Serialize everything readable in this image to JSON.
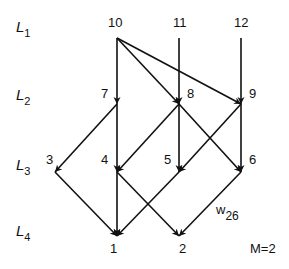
{
  "diagram": {
    "layers": [
      {
        "id": "L1",
        "base": "L",
        "sub": "1",
        "x": 16,
        "y": 19
      },
      {
        "id": "L2",
        "base": "L",
        "sub": "2",
        "x": 16,
        "y": 87
      },
      {
        "id": "L3",
        "base": "L",
        "sub": "3",
        "x": 16,
        "y": 157
      },
      {
        "id": "L4",
        "base": "L",
        "sub": "4",
        "x": 16,
        "y": 223
      }
    ],
    "nodes": [
      {
        "id": "10",
        "label": "10",
        "x": 117,
        "y": 38,
        "lx": 108,
        "ly": 16
      },
      {
        "id": "11",
        "label": "11",
        "x": 179,
        "y": 38,
        "lx": 173,
        "ly": 16
      },
      {
        "id": "12",
        "label": "12",
        "x": 241,
        "y": 38,
        "lx": 234,
        "ly": 16
      },
      {
        "id": "7",
        "label": "7",
        "x": 117,
        "y": 104,
        "lx": 101,
        "ly": 87
      },
      {
        "id": "8",
        "label": "8",
        "x": 179,
        "y": 104,
        "lx": 187,
        "ly": 87
      },
      {
        "id": "9",
        "label": "9",
        "x": 241,
        "y": 104,
        "lx": 249,
        "ly": 87
      },
      {
        "id": "3",
        "label": "3",
        "x": 55,
        "y": 172,
        "lx": 46,
        "ly": 153
      },
      {
        "id": "4",
        "label": "4",
        "x": 117,
        "y": 172,
        "lx": 101,
        "ly": 153
      },
      {
        "id": "5",
        "label": "5",
        "x": 179,
        "y": 172,
        "lx": 164,
        "ly": 153
      },
      {
        "id": "6",
        "label": "6",
        "x": 241,
        "y": 172,
        "lx": 249,
        "ly": 153
      },
      {
        "id": "1",
        "label": "1",
        "x": 117,
        "y": 236,
        "lx": 110,
        "ly": 242
      },
      {
        "id": "2",
        "label": "2",
        "x": 179,
        "y": 236,
        "lx": 179,
        "ly": 242
      }
    ],
    "edges": [
      {
        "from": "10",
        "to": "7"
      },
      {
        "from": "10",
        "to": "8"
      },
      {
        "from": "10",
        "to": "9"
      },
      {
        "from": "11",
        "to": "8"
      },
      {
        "from": "12",
        "to": "9"
      },
      {
        "from": "7",
        "to": "3"
      },
      {
        "from": "7",
        "to": "4"
      },
      {
        "from": "8",
        "to": "4"
      },
      {
        "from": "8",
        "to": "5"
      },
      {
        "from": "8",
        "to": "6"
      },
      {
        "from": "9",
        "to": "5"
      },
      {
        "from": "9",
        "to": "6"
      },
      {
        "from": "3",
        "to": "1"
      },
      {
        "from": "4",
        "to": "1"
      },
      {
        "from": "4",
        "to": "2"
      },
      {
        "from": "5",
        "to": "1"
      },
      {
        "from": "6",
        "to": "2"
      }
    ],
    "weight_label": {
      "base": "w",
      "sub": "26",
      "x": 216,
      "y": 203
    },
    "param_label": {
      "text": "M=2",
      "x": 250,
      "y": 242
    },
    "colors": {
      "line": "#111111",
      "text": "#111111",
      "background": "#ffffff"
    }
  }
}
